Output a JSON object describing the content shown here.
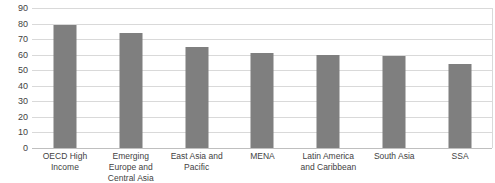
{
  "chart_data": {
    "type": "bar",
    "title": "",
    "subtitle": "",
    "xlabel": "",
    "ylabel": "",
    "categories": [
      "OECD High Income",
      "Emerging Europe and Central Asia",
      "East Asia and Pacific",
      "MENA",
      "Latin America and Caribbean",
      "South Asia",
      "SSA"
    ],
    "values": [
      79,
      74,
      65,
      61,
      60,
      59,
      54
    ],
    "ylim": [
      0,
      90
    ],
    "ytick_step": 10,
    "yticks": [
      90,
      80,
      70,
      60,
      50,
      40,
      30,
      20,
      10,
      0
    ],
    "ytick_labels": [
      "90",
      "80",
      "70",
      "60",
      "50",
      "40",
      "30",
      "20",
      "10",
      "0"
    ],
    "grid": true,
    "grid_axis": "y",
    "legend": false,
    "legend_position": "none",
    "bar_color": "#7f7f7f",
    "grid_color": "#d9d9d9",
    "axis_color": "#bfbfbf",
    "text_color": "#3f3f3f",
    "background_color": "#ffffff"
  }
}
